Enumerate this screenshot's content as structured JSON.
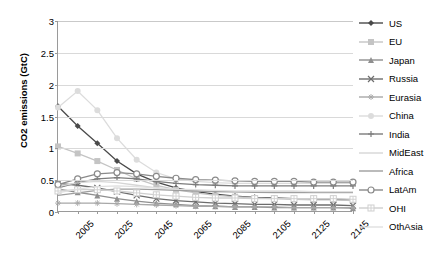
{
  "chart_data": {
    "type": "line",
    "title": "",
    "xlabel": "",
    "ylabel": "CO2 emissions (GtC)",
    "ylim": [
      0,
      3
    ],
    "yticks": [
      "0",
      "0.5",
      "1",
      "1.5",
      "2",
      "2.5",
      "3"
    ],
    "ytick_values": [
      0,
      0.5,
      1,
      1.5,
      2,
      2.5,
      3
    ],
    "grid": true,
    "legend_position": "right",
    "x": [
      2005,
      2015,
      2025,
      2035,
      2045,
      2055,
      2065,
      2075,
      2085,
      2095,
      2105,
      2115,
      2125,
      2135,
      2145,
      2155
    ],
    "xtick_labels": [
      "2005",
      "2025",
      "2045",
      "2065",
      "2085",
      "2105",
      "2125",
      "2145"
    ],
    "xtick_values": [
      2005,
      2025,
      2045,
      2065,
      2085,
      2105,
      2125,
      2145
    ],
    "series": [
      {
        "name": "US",
        "color": "#4a4a4a",
        "marker": "diamond",
        "values": [
          1.66,
          1.35,
          1.08,
          0.8,
          0.6,
          0.47,
          0.38,
          0.32,
          0.28,
          0.25,
          0.23,
          0.22,
          0.21,
          0.2,
          0.2,
          0.19
        ]
      },
      {
        "name": "EU",
        "color": "#c4c4c4",
        "marker": "square",
        "values": [
          1.03,
          0.92,
          0.8,
          0.66,
          0.52,
          0.42,
          0.35,
          0.3,
          0.26,
          0.24,
          0.22,
          0.21,
          0.2,
          0.19,
          0.19,
          0.18
        ]
      },
      {
        "name": "Japan",
        "color": "#8f8f8f",
        "marker": "triangle",
        "values": [
          0.36,
          0.31,
          0.26,
          0.21,
          0.17,
          0.14,
          0.12,
          0.1,
          0.09,
          0.08,
          0.08,
          0.07,
          0.07,
          0.07,
          0.07,
          0.06
        ]
      },
      {
        "name": "Russia",
        "color": "#6d6d6d",
        "marker": "x",
        "values": [
          0.45,
          0.42,
          0.38,
          0.32,
          0.26,
          0.21,
          0.18,
          0.16,
          0.14,
          0.13,
          0.12,
          0.12,
          0.11,
          0.11,
          0.11,
          0.1
        ]
      },
      {
        "name": "Eurasia",
        "color": "#a8a8a8",
        "marker": "star",
        "values": [
          0.14,
          0.14,
          0.14,
          0.13,
          0.12,
          0.11,
          0.1,
          0.09,
          0.09,
          0.08,
          0.08,
          0.08,
          0.07,
          0.07,
          0.07,
          0.07
        ]
      },
      {
        "name": "China",
        "color": "#dcdcdc",
        "marker": "circle",
        "values": [
          1.64,
          1.9,
          1.6,
          1.16,
          0.82,
          0.62,
          0.52,
          0.48,
          0.46,
          0.45,
          0.45,
          0.45,
          0.45,
          0.45,
          0.45,
          0.45
        ]
      },
      {
        "name": "India",
        "color": "#7c7c7c",
        "marker": "plus",
        "values": [
          0.38,
          0.46,
          0.52,
          0.54,
          0.52,
          0.48,
          0.45,
          0.43,
          0.42,
          0.41,
          0.41,
          0.41,
          0.41,
          0.41,
          0.41,
          0.41
        ]
      },
      {
        "name": "MidEast",
        "color": "#d6d6d6",
        "marker": "none",
        "values": [
          0.4,
          0.46,
          0.48,
          0.46,
          0.42,
          0.38,
          0.35,
          0.33,
          0.32,
          0.31,
          0.31,
          0.3,
          0.3,
          0.3,
          0.3,
          0.3
        ]
      },
      {
        "name": "Africa",
        "color": "#9e9e9e",
        "marker": "none",
        "values": [
          0.26,
          0.3,
          0.34,
          0.36,
          0.36,
          0.35,
          0.34,
          0.33,
          0.32,
          0.32,
          0.31,
          0.31,
          0.31,
          0.31,
          0.31,
          0.31
        ]
      },
      {
        "name": "LatAm",
        "color": "#8a8a8a",
        "marker": "open-circle",
        "values": [
          0.43,
          0.52,
          0.6,
          0.62,
          0.6,
          0.56,
          0.53,
          0.51,
          0.5,
          0.49,
          0.48,
          0.48,
          0.48,
          0.47,
          0.47,
          0.47
        ]
      },
      {
        "name": "OHI",
        "color": "#cfcfcf",
        "marker": "open-plus",
        "values": [
          0.33,
          0.35,
          0.35,
          0.33,
          0.3,
          0.27,
          0.25,
          0.23,
          0.22,
          0.22,
          0.21,
          0.21,
          0.21,
          0.21,
          0.21,
          0.2
        ]
      },
      {
        "name": "OthAsia",
        "color": "#e0e0e0",
        "marker": "none",
        "values": [
          0.3,
          0.36,
          0.4,
          0.41,
          0.4,
          0.38,
          0.36,
          0.35,
          0.34,
          0.33,
          0.33,
          0.33,
          0.33,
          0.32,
          0.32,
          0.32
        ]
      }
    ]
  }
}
